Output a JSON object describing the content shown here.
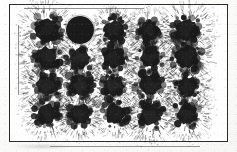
{
  "figure": {
    "background_color": "#fdfdfc",
    "ink_color": "#1a1a1a",
    "frame": {
      "label": "plot frame",
      "color": "#2a2a2a",
      "stroke_width": 1.6,
      "x": 9,
      "y": 4,
      "width": 219,
      "height": 138
    },
    "grid": {
      "rows": 4,
      "columns": 5,
      "count": 20,
      "column_centers": [
        38,
        70,
        105,
        140,
        177
      ],
      "row_centers": [
        26,
        53,
        82,
        110
      ]
    }
  },
  "chart_data": {
    "type": "scatter",
    "subtitle": "",
    "xlabel": "",
    "ylabel": "",
    "xlim": [
      0,
      219
    ],
    "ylim": [
      0,
      138
    ],
    "grid": false,
    "legend": "none",
    "annotations": [],
    "categories": [
      "row-1",
      "row-2",
      "row-3",
      "row-4"
    ],
    "blots": [
      {
        "id": "blot-r1c1",
        "row": 1,
        "col": 1,
        "cx": 38,
        "cy": 26,
        "radius": 15.0,
        "style": "spatter",
        "darkness": 0.86,
        "spray": 1.15,
        "seed": 11
      },
      {
        "id": "blot-r1c2",
        "row": 1,
        "col": 2,
        "cx": 71,
        "cy": 26,
        "radius": 14.0,
        "style": "solid",
        "darkness": 1.0,
        "spray": 0.0,
        "seed": 22
      },
      {
        "id": "blot-r1c3",
        "row": 1,
        "col": 3,
        "cx": 105,
        "cy": 26,
        "radius": 12.5,
        "style": "spatter",
        "darkness": 0.8,
        "spray": 1.05,
        "seed": 33
      },
      {
        "id": "blot-r1c4",
        "row": 1,
        "col": 4,
        "cx": 140,
        "cy": 27,
        "radius": 12.5,
        "style": "spatter",
        "darkness": 0.82,
        "spray": 1.0,
        "seed": 44
      },
      {
        "id": "blot-r1c5",
        "row": 1,
        "col": 5,
        "cx": 177,
        "cy": 26,
        "radius": 14.5,
        "style": "spatter",
        "darkness": 0.84,
        "spray": 1.2,
        "seed": 55
      },
      {
        "id": "blot-r2c1",
        "row": 2,
        "col": 1,
        "cx": 38,
        "cy": 54,
        "radius": 14.0,
        "style": "spatter",
        "darkness": 0.8,
        "spray": 1.2,
        "seed": 66
      },
      {
        "id": "blot-r2c2",
        "row": 2,
        "col": 2,
        "cx": 71,
        "cy": 54,
        "radius": 13.0,
        "style": "spatter",
        "darkness": 0.72,
        "spray": 1.1,
        "seed": 77
      },
      {
        "id": "blot-r2c3",
        "row": 2,
        "col": 3,
        "cx": 105,
        "cy": 54,
        "radius": 13.5,
        "style": "spatter",
        "darkness": 0.84,
        "spray": 1.15,
        "seed": 88
      },
      {
        "id": "blot-r2c4",
        "row": 2,
        "col": 4,
        "cx": 141,
        "cy": 54,
        "radius": 12.5,
        "style": "spatter",
        "darkness": 0.82,
        "spray": 1.05,
        "seed": 99
      },
      {
        "id": "blot-r2c5",
        "row": 2,
        "col": 5,
        "cx": 178,
        "cy": 53,
        "radius": 14.5,
        "style": "spatter",
        "darkness": 0.86,
        "spray": 1.05,
        "seed": 110
      },
      {
        "id": "blot-r3c1",
        "row": 3,
        "col": 1,
        "cx": 38,
        "cy": 82,
        "radius": 13.5,
        "style": "spatter",
        "darkness": 0.78,
        "spray": 1.25,
        "seed": 121
      },
      {
        "id": "blot-r3c2",
        "row": 3,
        "col": 2,
        "cx": 71,
        "cy": 81,
        "radius": 13.5,
        "style": "spatter",
        "darkness": 0.74,
        "spray": 1.3,
        "seed": 132
      },
      {
        "id": "blot-r3c3",
        "row": 3,
        "col": 3,
        "cx": 105,
        "cy": 82,
        "radius": 13.0,
        "style": "spatter",
        "darkness": 0.7,
        "spray": 1.35,
        "seed": 143
      },
      {
        "id": "blot-r3c4",
        "row": 3,
        "col": 4,
        "cx": 141,
        "cy": 81,
        "radius": 14.0,
        "style": "spatter",
        "darkness": 0.8,
        "spray": 1.2,
        "seed": 154
      },
      {
        "id": "blot-r3c5",
        "row": 3,
        "col": 5,
        "cx": 178,
        "cy": 82,
        "radius": 12.5,
        "style": "spatter",
        "darkness": 0.84,
        "spray": 1.1,
        "seed": 165
      },
      {
        "id": "blot-r4c1",
        "row": 4,
        "col": 1,
        "cx": 38,
        "cy": 110,
        "radius": 13.0,
        "style": "spatter",
        "darkness": 0.84,
        "spray": 1.1,
        "seed": 176
      },
      {
        "id": "blot-r4c2",
        "row": 4,
        "col": 2,
        "cx": 71,
        "cy": 110,
        "radius": 12.5,
        "style": "spatter",
        "darkness": 0.8,
        "spray": 1.15,
        "seed": 187
      },
      {
        "id": "blot-r4c3",
        "row": 4,
        "col": 3,
        "cx": 106,
        "cy": 110,
        "radius": 13.0,
        "style": "spatter",
        "darkness": 0.86,
        "spray": 1.05,
        "seed": 198
      },
      {
        "id": "blot-r4c4",
        "row": 4,
        "col": 4,
        "cx": 141,
        "cy": 111,
        "radius": 13.5,
        "style": "spatter",
        "darkness": 0.78,
        "spray": 1.3,
        "seed": 209
      },
      {
        "id": "blot-r4c5",
        "row": 4,
        "col": 5,
        "cx": 178,
        "cy": 110,
        "radius": 13.0,
        "style": "spatter",
        "darkness": 0.82,
        "spray": 1.25,
        "seed": 220
      }
    ]
  }
}
